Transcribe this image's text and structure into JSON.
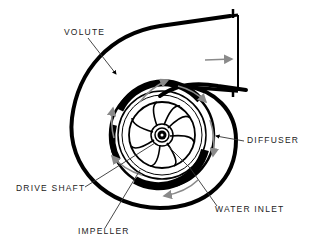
{
  "labels": {
    "volute": "VOLUTE",
    "diffuser": "DIFFUSER",
    "drive_shaft": "DRIVE SHAFT",
    "water_inlet": "WATER INLET",
    "impeller": "IMPELLER"
  },
  "colors": {
    "outline": "#000000",
    "flow_arrows": "#8a8a8a",
    "leader_lines": "#333333",
    "background": "#ffffff"
  },
  "components": [
    {
      "name": "volute",
      "type": "spiral casing"
    },
    {
      "name": "diffuser",
      "type": "vane ring"
    },
    {
      "name": "impeller",
      "type": "curved blades",
      "blade_count": 8
    },
    {
      "name": "drive_shaft",
      "type": "hub"
    },
    {
      "name": "outlet",
      "type": "discharge nozzle"
    }
  ]
}
